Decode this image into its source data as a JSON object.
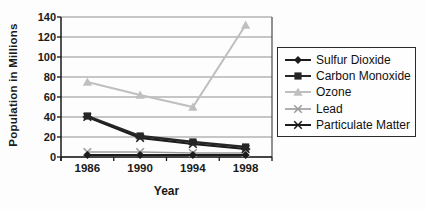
{
  "chart_data": {
    "type": "line",
    "title": "",
    "xlabel": "Year",
    "ylabel": "Population in Millions",
    "categories": [
      "1986",
      "1990",
      "1994",
      "1998"
    ],
    "ylim": [
      0,
      140
    ],
    "yticks": [
      0,
      20,
      40,
      60,
      80,
      100,
      120,
      140
    ],
    "grid": "horizontal-only",
    "legend_position": "right-outside-boxed",
    "series": [
      {
        "name": "Sulfur Dioxide",
        "values": [
          2,
          2,
          2,
          2
        ],
        "color": "#1c1c1c",
        "marker": "diamond",
        "line_width": 2
      },
      {
        "name": "Carbon Monoxide",
        "values": [
          41,
          21,
          15,
          10
        ],
        "color": "#262626",
        "marker": "square",
        "line_width": 2.4
      },
      {
        "name": "Ozone",
        "values": [
          75,
          62,
          50,
          132
        ],
        "color": "#bfbfbf",
        "marker": "triangle",
        "line_width": 2
      },
      {
        "name": "Lead",
        "values": [
          5,
          5,
          4,
          4
        ],
        "color": "#9c9c9c",
        "marker": "x",
        "line_width": 1.6
      },
      {
        "name": "Particulate Matter",
        "values": [
          40,
          19,
          13,
          8
        ],
        "color": "#1c1c1c",
        "marker": "star",
        "line_width": 2.2
      }
    ]
  }
}
